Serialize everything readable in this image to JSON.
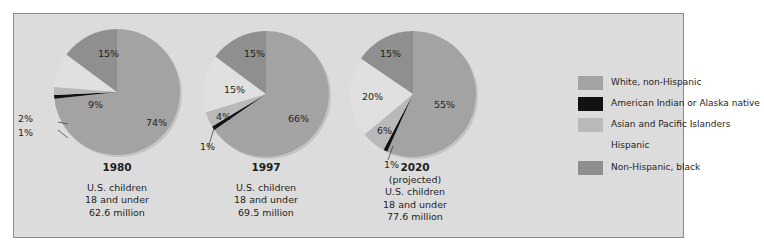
{
  "chart_data": {
    "type": "pie",
    "title": "",
    "colors": {
      "white_non_hispanic": "#a3a3a3",
      "american_indian_alaska_native": "#111111",
      "asian_pacific_islanders": "#b9b9b9",
      "hispanic": "#e2e2e2",
      "non_hispanic_black": "#8f8f8f",
      "background": "#dcdcdc"
    },
    "legend": {
      "placement": "right",
      "entries": [
        {
          "key": "white_non_hispanic",
          "label": "White, non-Hispanic"
        },
        {
          "key": "american_indian_alaska_native",
          "label": "American Indian or Alaska native"
        },
        {
          "key": "asian_pacific_islanders",
          "label": "Asian and Pacific Islanders"
        },
        {
          "key": "hispanic",
          "label": "Hispanic"
        },
        {
          "key": "non_hispanic_black",
          "label": "Non-Hispanic, black"
        }
      ]
    },
    "pies": [
      {
        "year": "1980",
        "note": "",
        "caption": [
          "U.S. children",
          "18 and under",
          "62.6 million"
        ],
        "slices": [
          {
            "key": "white_non_hispanic",
            "value": 74,
            "label": "74%"
          },
          {
            "key": "american_indian_alaska_native",
            "value": 1,
            "label": "1%"
          },
          {
            "key": "asian_pacific_islanders",
            "value": 2,
            "label": "2%"
          },
          {
            "key": "hispanic",
            "value": 9,
            "label": "9%"
          },
          {
            "key": "non_hispanic_black",
            "value": 15,
            "label": "15%"
          }
        ]
      },
      {
        "year": "1997",
        "note": "",
        "caption": [
          "U.S. children",
          "18 and under",
          "69.5 million"
        ],
        "slices": [
          {
            "key": "white_non_hispanic",
            "value": 66,
            "label": "66%"
          },
          {
            "key": "american_indian_alaska_native",
            "value": 1,
            "label": "1%"
          },
          {
            "key": "asian_pacific_islanders",
            "value": 4,
            "label": "4%"
          },
          {
            "key": "hispanic",
            "value": 15,
            "label": "15%"
          },
          {
            "key": "non_hispanic_black",
            "value": 15,
            "label": "15%"
          }
        ]
      },
      {
        "year": "2020",
        "note": "(projected)",
        "caption": [
          "U.S. children",
          "18 and under",
          "77.6 million"
        ],
        "slices": [
          {
            "key": "white_non_hispanic",
            "value": 55,
            "label": "55%"
          },
          {
            "key": "american_indian_alaska_native",
            "value": 1,
            "label": "1%"
          },
          {
            "key": "asian_pacific_islanders",
            "value": 6,
            "label": "6%"
          },
          {
            "key": "hispanic",
            "value": 20,
            "label": "20%"
          },
          {
            "key": "non_hispanic_black",
            "value": 15,
            "label": "15%"
          }
        ]
      }
    ]
  }
}
